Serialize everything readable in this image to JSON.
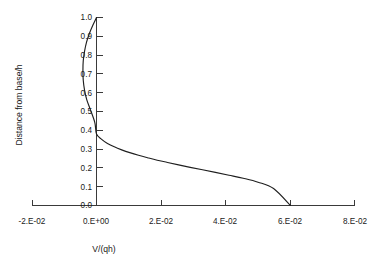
{
  "chart_data": {
    "type": "line",
    "title": "",
    "xlabel": "V/(qh)",
    "ylabel": "Distance from base/h",
    "xlim": [
      -0.02,
      0.08
    ],
    "ylim": [
      0.0,
      1.0
    ],
    "grid": false,
    "legend": "none",
    "background_color": "#ffffff",
    "line_color": "#1f1f1f",
    "axis_color": "#3a3a3a",
    "xticks": [
      -0.02,
      0.0,
      0.02,
      0.04,
      0.06,
      0.08
    ],
    "xtick_labels": [
      "-2.E-02",
      "0.E+00",
      "2.E-02",
      "4.E-02",
      "6.E-02",
      "8.E-02"
    ],
    "yticks": [
      0.0,
      0.1,
      0.2,
      0.3,
      0.4,
      0.5,
      0.6,
      0.7,
      0.8,
      0.9,
      1.0
    ],
    "ytick_labels": [
      "0.0",
      "0.1",
      "0.2",
      "0.3",
      "0.4",
      "0.5",
      "0.6",
      "0.7",
      "0.8",
      "0.9",
      "1.0"
    ],
    "series": [
      {
        "name": "velocity-profile",
        "x": [
          0.0,
          -0.0011,
          -0.0022,
          -0.0031,
          -0.0037,
          -0.0041,
          -0.0042,
          -0.0041,
          -0.0037,
          -0.003,
          -0.0019,
          -0.0005,
          0.0,
          0.0016,
          0.0034,
          0.0055,
          0.0078,
          0.0103,
          0.013,
          0.0158,
          0.0188,
          0.022,
          0.0254,
          0.029,
          0.0328,
          0.0368,
          0.041,
          0.0454,
          0.05,
          0.0548,
          0.06
        ],
        "y": [
          1.0,
          0.96,
          0.915,
          0.868,
          0.82,
          0.77,
          0.718,
          0.666,
          0.614,
          0.562,
          0.51,
          0.44,
          0.38,
          0.352,
          0.33,
          0.312,
          0.296,
          0.281,
          0.267,
          0.254,
          0.241,
          0.229,
          0.216,
          0.203,
          0.19,
          0.176,
          0.161,
          0.145,
          0.124,
          0.09,
          0.0
        ]
      }
    ]
  },
  "axes": {
    "x_title": "V/(qh)",
    "y_title": "Distance from base/h"
  }
}
